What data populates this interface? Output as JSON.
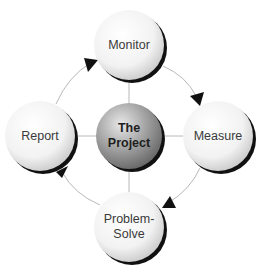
{
  "diagram": {
    "type": "cycle",
    "center": {
      "label_line1": "The",
      "label_line2": "Project",
      "color": "#8c8c8c"
    },
    "nodes": [
      {
        "id": "monitor",
        "label_line1": "Monitor",
        "label_line2": ""
      },
      {
        "id": "measure",
        "label_line1": "Measure",
        "label_line2": ""
      },
      {
        "id": "problem-solve",
        "label_line1": "Problem-",
        "label_line2": "Solve"
      },
      {
        "id": "report",
        "label_line1": "Report",
        "label_line2": ""
      }
    ],
    "edges": [
      {
        "from": "monitor",
        "to": "measure"
      },
      {
        "from": "measure",
        "to": "problem-solve"
      },
      {
        "from": "problem-solve",
        "to": "report"
      },
      {
        "from": "report",
        "to": "monitor"
      }
    ],
    "spokes": [
      "monitor",
      "measure",
      "problem-solve",
      "report"
    ],
    "colors": {
      "sphere": "#f4f4f4",
      "shadow": "#111111",
      "line": "#b8b8b8",
      "arrow": "#111111"
    }
  }
}
